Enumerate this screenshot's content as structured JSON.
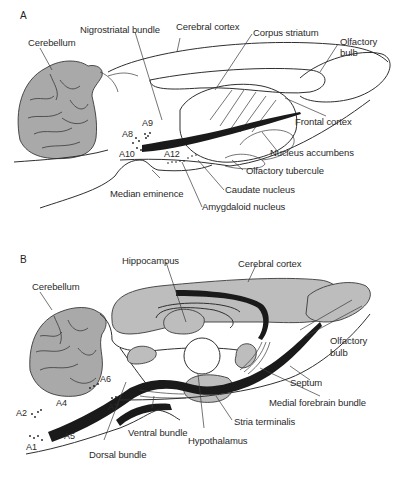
{
  "figure": {
    "panel_a": {
      "letter": "A",
      "labels": {
        "cerebellum": "Cerebellum",
        "nigrostriatal_bundle": "Nigrostriatal bundle",
        "cerebral_cortex": "Cerebral cortex",
        "corpus_striatum": "Corpus striatum",
        "olfactory_bulb_line1": "Olfactory",
        "olfactory_bulb_line2": "bulb",
        "frontal_cortex": "Frontal cortex",
        "nucleus_accumbens": "Nucleus accumbens",
        "olfactory_tubercule": "Olfactory tubercule",
        "caudate_nucleus": "Caudate nucleus",
        "amygdaloid_nucleus": "Amygdaloid nucleus",
        "median_eminence": "Median eminence"
      },
      "cell_groups": [
        "A8",
        "A9",
        "A10",
        "A12"
      ]
    },
    "panel_b": {
      "letter": "B",
      "labels": {
        "hippocampus": "Hippocampus",
        "cerebral_cortex": "Cerebral cortex",
        "cerebellum": "Cerebellum",
        "olfactory_bulb_line1": "Olfactory",
        "olfactory_bulb_line2": "bulb",
        "septum": "Septum",
        "medial_forebrain_bundle": "Medial forebrain bundle",
        "stria_terminalis": "Stria terminalis",
        "hypothalamus": "Hypothalamus",
        "ventral_bundle": "Ventral bundle",
        "dorsal_bundle": "Dorsal bundle"
      },
      "cell_groups": [
        "A1",
        "A2",
        "A4",
        "A5",
        "A6",
        "A7"
      ]
    },
    "colors": {
      "background": "#ffffff",
      "tissue_grey": "#a9a9a9",
      "bundle_black": "#1a1a1a",
      "line": "#3a3a3a"
    }
  }
}
